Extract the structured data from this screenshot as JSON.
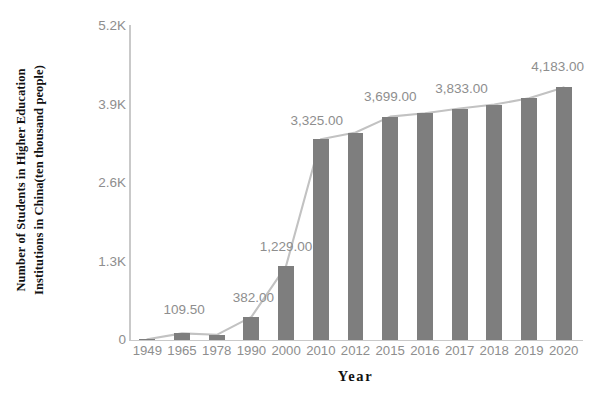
{
  "chart_data": {
    "type": "bar",
    "title": "",
    "subtitle": "",
    "xlabel": "Year",
    "ylabel": "Number of Students in Higher Education Institutions in China(ten thousand people)",
    "ylabel_lines": [
      "Number of Students in Higher Education",
      "Institutions in China(ten thousand people)"
    ],
    "categories": [
      "1949",
      "1965",
      "1978",
      "1990",
      "2000",
      "2010",
      "2012",
      "2015",
      "2016",
      "2017",
      "2018",
      "2019",
      "2020"
    ],
    "values": [
      11.7,
      109.5,
      86.0,
      382.0,
      1229.0,
      3325.0,
      3436.0,
      3699.0,
      3756.0,
      3833.0,
      3900.0,
      4002.0,
      4183.0
    ],
    "series": [
      {
        "name": "Number of students (bars)",
        "type": "bar",
        "values": [
          11.7,
          109.5,
          86.0,
          382.0,
          1229.0,
          3325.0,
          3436.0,
          3699.0,
          3756.0,
          3833.0,
          3900.0,
          4002.0,
          4183.0
        ]
      },
      {
        "name": "Number of students (trend line)",
        "type": "line",
        "values": [
          11.7,
          109.5,
          86.0,
          382.0,
          1229.0,
          3325.0,
          3436.0,
          3699.0,
          3756.0,
          3833.0,
          3900.0,
          4002.0,
          4183.0
        ]
      }
    ],
    "ylim": [
      0,
      5200
    ],
    "yticks": [
      0,
      1300,
      2600,
      3900,
      5200
    ],
    "ytick_labels": [
      "0",
      "1.3K",
      "2.6K",
      "3.9K",
      "5.2K"
    ],
    "xtick_labels": [
      "1949",
      "1965",
      "1978",
      "1990",
      "2000",
      "2010",
      "2012",
      "2015",
      "2016",
      "2017",
      "2018",
      "2019",
      "2020"
    ],
    "grid": false,
    "legend": "none",
    "data_labels": [
      {
        "category": "1965",
        "text": "109.50",
        "value": 109.5
      },
      {
        "category": "1990",
        "text": "382.00",
        "value": 382.0
      },
      {
        "category": "2000",
        "text": "1,229.00",
        "value": 1229.0
      },
      {
        "category": "2010",
        "text": "3,325.00",
        "value": 3325.0
      },
      {
        "category": "2015",
        "text": "3,699.00",
        "value": 3699.0
      },
      {
        "category": "2017",
        "text": "3,833.00",
        "value": 3833.0
      },
      {
        "category": "2020",
        "text": "4,183.00",
        "value": 4183.0
      }
    ],
    "colors": {
      "bar": "#7e7e7e",
      "line": "#c2c2c2",
      "axis": "#c9c9c9",
      "tick_text": "#8e8e8e",
      "data_label_text": "#8e8e8e",
      "axis_title_text": "#111111",
      "background": "#ffffff"
    }
  }
}
